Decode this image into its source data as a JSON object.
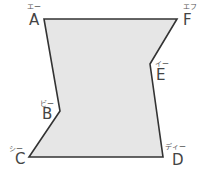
{
  "diagram": {
    "type": "hexagon-shape",
    "fill_color": "#e6e6e6",
    "stroke_color": "#333333",
    "vertices": [
      {
        "name": "A",
        "reading": "エー",
        "x": 44,
        "y": 19
      },
      {
        "name": "F",
        "reading": "エフ",
        "x": 177,
        "y": 19
      },
      {
        "name": "E",
        "reading": "イー",
        "x": 150,
        "y": 64
      },
      {
        "name": "D",
        "reading": "ディー",
        "x": 163,
        "y": 157
      },
      {
        "name": "C",
        "reading": "シー",
        "x": 29,
        "y": 157
      },
      {
        "name": "B",
        "reading": "ビー",
        "x": 60,
        "y": 111
      }
    ],
    "polygon_points": "44,19 177,19 150,64 163,157 29,157 60,111",
    "labels": {
      "A": {
        "letter": "A",
        "reading": "エー"
      },
      "B": {
        "letter": "B",
        "reading": "ビー"
      },
      "C": {
        "letter": "C",
        "reading": "シー"
      },
      "D": {
        "letter": "D",
        "reading": "ディー"
      },
      "E": {
        "letter": "E",
        "reading": "イー"
      },
      "F": {
        "letter": "F",
        "reading": "エフ"
      }
    }
  }
}
